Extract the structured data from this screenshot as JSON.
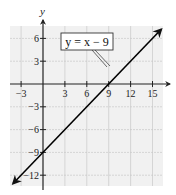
{
  "chart_data": {
    "type": "line",
    "title": "",
    "xlabel": "x",
    "ylabel": "y",
    "xlim": [
      -4.5,
      16.5
    ],
    "ylim": [
      -14,
      8
    ],
    "grid": true,
    "x_ticks": [
      -3,
      3,
      6,
      9,
      12,
      15
    ],
    "y_ticks": [
      6,
      3,
      -3,
      -6,
      -9,
      -12
    ],
    "x_tick_labels": [
      "−3",
      "3",
      "6",
      "9",
      "12",
      "15"
    ],
    "y_tick_labels": [
      "6",
      "3",
      "−3",
      "−6",
      "−9",
      "−12"
    ],
    "series": [
      {
        "name": "y = x − 9",
        "equation": "y = x - 9",
        "slope": 1,
        "intercept": -9,
        "x": [
          -4.1,
          0,
          9,
          16.2
        ],
        "y": [
          -13.1,
          -9,
          0,
          7.2
        ],
        "color": "#000000",
        "arrows": "both"
      }
    ],
    "annotations": [
      {
        "text": "y = x − 9",
        "type": "callout-box",
        "points_to": [
          10.5,
          1.5
        ]
      }
    ],
    "key_points": {
      "x_intercept": [
        9,
        0
      ],
      "y_intercept": [
        0,
        -9
      ]
    }
  },
  "labels": {
    "x_axis": "",
    "y_axis": "y",
    "equation": "y = x − 9"
  },
  "colors": {
    "grid_fill": "#f1f1f1",
    "grid_line": "#c8c8c8",
    "axis": "#222222",
    "line": "#000000"
  }
}
